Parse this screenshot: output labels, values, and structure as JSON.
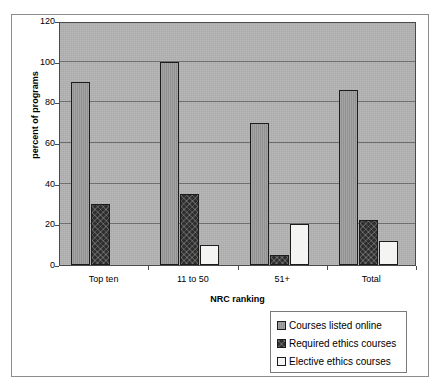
{
  "chart_data": {
    "type": "bar",
    "title": "",
    "xlabel": "NRC ranking",
    "ylabel": "percent of programs",
    "ylim": [
      0,
      120
    ],
    "ytick_step": 20,
    "yticks": [
      0,
      20,
      40,
      60,
      80,
      100,
      120
    ],
    "grid": true,
    "legend_position": "bottom-right",
    "categories": [
      "Top ten",
      "11 to 50",
      "51+",
      "Total"
    ],
    "series": [
      {
        "name": "Courses listed online",
        "color": "#9a9a9a",
        "values": [
          90,
          100,
          70,
          86
        ]
      },
      {
        "name": "Required ethics courses",
        "color": "#2e2e2e",
        "values": [
          30,
          35,
          5,
          22
        ]
      },
      {
        "name": "Elective ethics courses",
        "color": "#f4f4f2",
        "values": [
          0,
          10,
          20,
          12
        ]
      }
    ]
  },
  "axes": {
    "y_title": "percent of programs",
    "x_title": "NRC ranking",
    "y_tick_labels": [
      "120",
      "100",
      "80",
      "60",
      "40",
      "20",
      "0"
    ],
    "x_tick_labels": [
      "Top ten",
      "11 to 50",
      "51+",
      "Total"
    ]
  },
  "legend": {
    "items": [
      {
        "label": "Courses listed online",
        "swatch": "legend-swatch-courses-online"
      },
      {
        "label": "Required ethics courses",
        "swatch": "legend-swatch-required-ethics"
      },
      {
        "label": "Elective ethics courses",
        "swatch": "legend-swatch-elective-ethics"
      }
    ]
  },
  "colors": {
    "plot_background": "#b0b0b0",
    "gridline": "#6e6e6e",
    "axis": "#4a4a4a",
    "frame": "#8d8d8d",
    "bar_border": "#1c1c1c",
    "page_background": "#ffffff"
  }
}
